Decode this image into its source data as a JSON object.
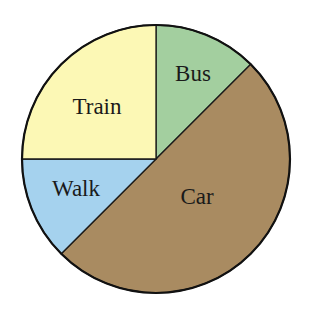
{
  "chart_data": {
    "type": "pie",
    "title": "",
    "categories": [
      "Bus",
      "Car",
      "Walk",
      "Train"
    ],
    "values": [
      12.5,
      50,
      12.5,
      25
    ],
    "units": "percent (estimated from angles)",
    "start_angle_deg": 0,
    "direction": "clockwise",
    "colors": {
      "Bus": "#a3cf9f",
      "Car": "#a98b61",
      "Walk": "#a5d2ee",
      "Train": "#fcf8b5"
    },
    "legend": "none (labels inside slices)"
  },
  "labels": {
    "bus": "Bus",
    "car": "Car",
    "walk": "Walk",
    "train": "Train"
  }
}
